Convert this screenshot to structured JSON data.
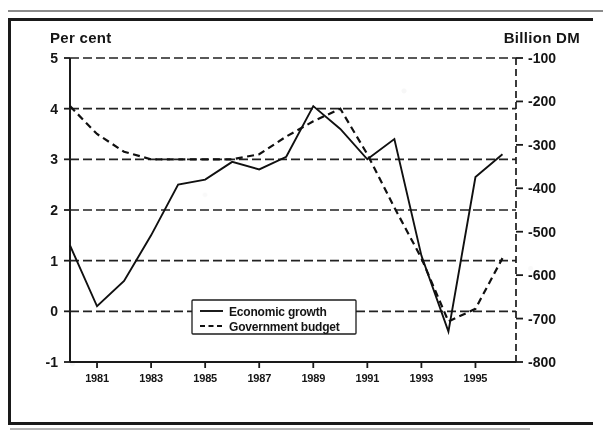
{
  "document": {
    "kind": "scanned-chart",
    "border_color": "#1a1a1a",
    "background_color": "#ffffff",
    "ink_color": "#101010"
  },
  "chart_data": {
    "type": "line",
    "title": "",
    "subtitle": "",
    "xlabel": "",
    "ylabel": "Per cent",
    "y2label": "Billion DM",
    "grid": true,
    "legend_position": "inside-bottom-center",
    "x": [
      1980,
      1981,
      1982,
      1983,
      1984,
      1985,
      1986,
      1987,
      1988,
      1989,
      1990,
      1991,
      1992,
      1993,
      1994,
      1995,
      1996
    ],
    "xlim": [
      1980,
      1996.5
    ],
    "xticks": [
      1981,
      1983,
      1985,
      1987,
      1989,
      1991,
      1993,
      1995
    ],
    "xtick_labels": [
      "1981",
      "1983",
      "1985",
      "1987",
      "1989",
      "1991",
      "1993",
      "1995"
    ],
    "ylim": [
      -1,
      5
    ],
    "yticks": [
      5,
      4,
      3,
      2,
      1,
      0,
      -1
    ],
    "ytick_labels": [
      "5",
      "4",
      "3",
      "2",
      "1",
      "0",
      "-1"
    ],
    "y2lim": [
      -800,
      -100
    ],
    "y2ticks": [
      -100,
      -200,
      -300,
      -400,
      -500,
      -600,
      -700,
      -800
    ],
    "y2tick_labels": [
      "-100",
      "-200",
      "-300",
      "-400",
      "-500",
      "-600",
      "-700",
      "-800"
    ],
    "series": [
      {
        "name": "Economic growth",
        "style": "solid",
        "axis": "left",
        "unit": "per cent",
        "values": [
          1.3,
          0.1,
          0.6,
          1.5,
          2.5,
          2.6,
          2.95,
          2.8,
          3.05,
          4.05,
          3.6,
          3.0,
          3.4,
          1.1,
          -0.4,
          2.65,
          3.1
        ]
      },
      {
        "name": "Government budget",
        "style": "dashed",
        "axis": "right",
        "unit": "billion DM",
        "values_percent_scale": [
          4.05,
          3.5,
          3.15,
          3.0,
          3.0,
          3.0,
          3.0,
          3.1,
          3.45,
          3.75,
          4.0,
          3.1,
          2.05,
          1.05,
          -0.2,
          0.05,
          1.05
        ],
        "values": [
          -438,
          -503,
          -541,
          -558,
          -558,
          -558,
          -558,
          -546,
          -505,
          -470,
          -442,
          -546,
          -669,
          -785,
          -930,
          -901,
          -785
        ]
      }
    ],
    "legend_entries": [
      {
        "label": "Economic growth",
        "style": "solid"
      },
      {
        "label": "Government budget",
        "style": "dashed"
      }
    ]
  }
}
